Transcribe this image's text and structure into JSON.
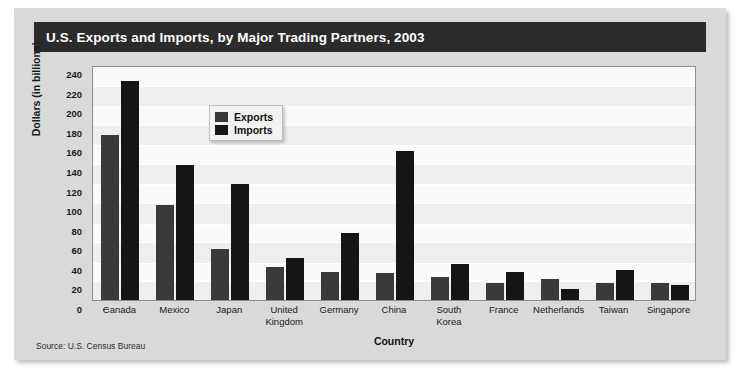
{
  "title": "U.S. Exports and Imports, by Major Trading Partners, 2003",
  "source": "Source: U.S. Census Bureau",
  "legend": {
    "exports_label": "Exports",
    "imports_label": "Imports"
  },
  "colors": {
    "exports": "#3a3a3a",
    "imports": "#151515",
    "title_bar": "#2b2b2b",
    "card": "#d9d9d9",
    "plot_background": "#fafafa"
  },
  "chart_data": {
    "type": "bar",
    "title": "U.S. Exports and Imports, by Major Trading Partners, 2003",
    "xlabel": "Country",
    "ylabel": "Dollars (in billions)",
    "ylim": [
      0,
      240
    ],
    "yticks": [
      0,
      20,
      40,
      60,
      80,
      100,
      120,
      140,
      160,
      180,
      200,
      220,
      240
    ],
    "grid": true,
    "legend_position": "inside-top-left",
    "categories": [
      "Canada",
      "Mexico",
      "Japan",
      "United Kingdom",
      "Germany",
      "China",
      "South Korea",
      "France",
      "Netherlands",
      "Taiwan",
      "Singapore"
    ],
    "category_lines": [
      [
        "Canada"
      ],
      [
        "Mexico"
      ],
      [
        "Japan"
      ],
      [
        "United",
        "Kingdom"
      ],
      [
        "Germany"
      ],
      [
        "China"
      ],
      [
        "South",
        "Korea"
      ],
      [
        "France"
      ],
      [
        "Netherlands"
      ],
      [
        "Taiwan"
      ],
      [
        "Singapore"
      ]
    ],
    "series": [
      {
        "name": "Exports",
        "values": [
          169,
          97,
          52,
          34,
          29,
          28,
          24,
          17,
          21,
          17,
          17
        ]
      },
      {
        "name": "Imports",
        "values": [
          224,
          138,
          118,
          43,
          68,
          152,
          37,
          29,
          11,
          31,
          15
        ]
      }
    ]
  }
}
